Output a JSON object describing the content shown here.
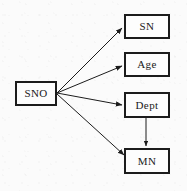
{
  "diagram": {
    "type": "functional-dependency-diagram",
    "background_color": "#fbfbfb",
    "line_color": "#1c1c1c",
    "box_border_color": "#1c1c1c",
    "box_fill_color": "#fdfdfd",
    "nodes": [
      {
        "id": "sno",
        "label": "SNO",
        "x": 15,
        "y": 81,
        "w": 42,
        "h": 25
      },
      {
        "id": "sn",
        "label": "SN",
        "x": 124,
        "y": 14,
        "w": 46,
        "h": 25
      },
      {
        "id": "age",
        "label": "Age",
        "x": 124,
        "y": 52,
        "w": 46,
        "h": 25
      },
      {
        "id": "dept",
        "label": "Dept",
        "x": 124,
        "y": 92,
        "w": 46,
        "h": 26
      },
      {
        "id": "mn",
        "label": "MN",
        "x": 124,
        "y": 148,
        "w": 46,
        "h": 26
      }
    ],
    "edges": [
      {
        "id": "sno-to-sn",
        "from": "sno",
        "to": "sn",
        "style": "arrow"
      },
      {
        "id": "sno-to-age",
        "from": "sno",
        "to": "age",
        "style": "arrow"
      },
      {
        "id": "sno-to-dept",
        "from": "sno",
        "to": "dept",
        "style": "arrow"
      },
      {
        "id": "sno-to-mn",
        "from": "sno",
        "to": "mn",
        "style": "arrow"
      },
      {
        "id": "dept-to-mn",
        "from": "dept",
        "to": "mn",
        "style": "arrow"
      }
    ]
  }
}
